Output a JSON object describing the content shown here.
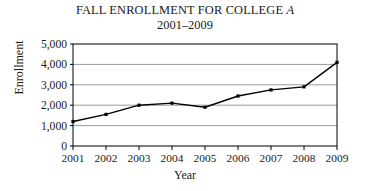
{
  "chart_data": {
    "type": "line",
    "title": "FALL ENROLLMENT FOR COLLEGE A",
    "title_plain": "FALL ENROLLMENT FOR COLLEGE ",
    "title_emphasis": "A",
    "subtitle": "2001–2009",
    "xlabel": "Year",
    "ylabel": "Enrollment",
    "categories": [
      "2001",
      "2002",
      "2003",
      "2004",
      "2005",
      "2006",
      "2007",
      "2008",
      "2009"
    ],
    "values": [
      1200,
      1550,
      2000,
      2100,
      1900,
      2450,
      2750,
      2900,
      4100
    ],
    "ylim": [
      0,
      5000
    ],
    "ytick_values": [
      0,
      1000,
      2000,
      3000,
      4000,
      5000
    ],
    "ytick_labels": [
      "0",
      "1,000",
      "2,000",
      "3,000",
      "4,000",
      "5,000"
    ],
    "grid": "horizontal",
    "legend": "none",
    "marker": "square",
    "line_color": "#000000",
    "grid_color": "#9a9a9a",
    "axis_color": "#000000",
    "background_color": "#ffffff"
  }
}
